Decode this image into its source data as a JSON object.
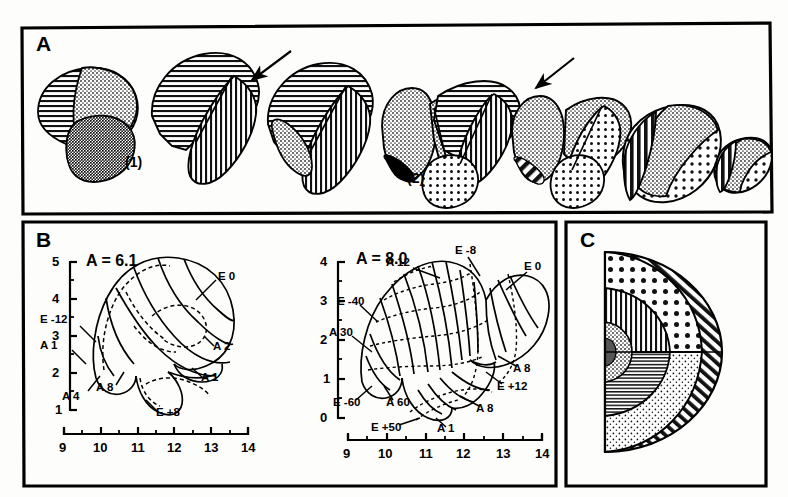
{
  "figure": {
    "panels": [
      "A",
      "B",
      "C"
    ],
    "background_color": "#fdfdfb",
    "ink_color": "#000000"
  },
  "panel_a": {
    "letter": "A",
    "caption_marks": [
      {
        "label": "(1)",
        "x": 128,
        "y": 165
      },
      {
        "label": "(2)",
        "x": 410,
        "y": 182
      }
    ],
    "arrows": [
      {
        "name": "arrow-upper-left",
        "x1": 289,
        "y1": 53,
        "x2": 252,
        "y2": 80
      },
      {
        "name": "arrow-upper-right",
        "x1": 572,
        "y1": 60,
        "x2": 536,
        "y2": 88
      }
    ],
    "specimens": [
      {
        "index": 1,
        "fills": [
          "horizontal-hatch",
          "stipple-medium",
          "stipple-coarse"
        ]
      },
      {
        "index": 2,
        "fills": [
          "horizontal-hatch",
          "vertical-hatch"
        ]
      },
      {
        "index": 3,
        "fills": [
          "horizontal-hatch",
          "vertical-hatch",
          "stipple-medium"
        ]
      },
      {
        "index": 4,
        "fills": [
          "stipple-medium",
          "horizontal-hatch",
          "vertical-hatch",
          "dot-grid",
          "solid-black"
        ]
      },
      {
        "index": 5,
        "fills": [
          "stipple-medium",
          "dot-grid",
          "solid-black"
        ]
      },
      {
        "index": 6,
        "fills": [
          "stipple-medium",
          "dot-grid",
          "vertical-hatch-bold"
        ]
      },
      {
        "index": 7,
        "fills": [
          "dot-grid",
          "vertical-hatch-bold"
        ]
      }
    ]
  },
  "panel_b": {
    "letter": "B",
    "charts": [
      {
        "id": "chart-left",
        "title": "A = 6.1",
        "x_axis": {
          "min": 9,
          "max": 14,
          "ticks": [
            9,
            10,
            11,
            12,
            13,
            14
          ],
          "minor_per_major": 2
        },
        "y_axis": {
          "min": 1,
          "max": 5,
          "ticks": [
            1,
            2,
            3,
            4,
            5
          ],
          "minor_per_major": 2
        },
        "annotations": [
          {
            "label": "E 0",
            "lx": 222,
            "ly": 276,
            "tx": 198,
            "ty": 296
          },
          {
            "label": "E -12",
            "lx": 62,
            "ly": 320,
            "tx": 85,
            "ty": 335
          },
          {
            "label": "A 1",
            "lx": 54,
            "ly": 344,
            "tx": 72,
            "ty": 360
          },
          {
            "label": "A 2",
            "lx": 216,
            "ly": 350,
            "tx": 200,
            "ty": 337
          },
          {
            "label": "A 1",
            "lx": 204,
            "ly": 381,
            "tx": 190,
            "ty": 369
          },
          {
            "label": "A 4",
            "lx": 68,
            "ly": 397,
            "tx": 88,
            "ty": 377
          },
          {
            "label": "A 8",
            "lx": 100,
            "ly": 389,
            "tx": 112,
            "ty": 372
          },
          {
            "label": "E +8",
            "lx": 155,
            "ly": 415,
            "tx": 140,
            "ty": 398
          }
        ]
      },
      {
        "id": "chart-right",
        "title": "A = 8.0",
        "x_axis": {
          "min": 9,
          "max": 14,
          "ticks": [
            9,
            10,
            11,
            12,
            13,
            14
          ],
          "minor_per_major": 2
        },
        "y_axis": {
          "min": 0,
          "max": 4,
          "ticks": [
            0,
            1,
            2,
            3,
            4
          ],
          "minor_per_major": 2
        },
        "annotations": [
          {
            "label": "A 12",
            "lx": 409,
            "ly": 262,
            "tx": 438,
            "ty": 276
          },
          {
            "label": "E -8",
            "lx": 466,
            "ly": 251,
            "tx": 478,
            "ty": 272
          },
          {
            "label": "E 0",
            "lx": 528,
            "ly": 266,
            "tx": 506,
            "ty": 288
          },
          {
            "label": "E -40",
            "lx": 344,
            "ly": 301,
            "tx": 372,
            "ty": 320
          },
          {
            "label": "A 30",
            "lx": 336,
            "ly": 332,
            "tx": 368,
            "ty": 349
          },
          {
            "label": "A 8",
            "lx": 516,
            "ly": 370,
            "tx": 498,
            "ty": 357
          },
          {
            "label": "E +12",
            "lx": 498,
            "ly": 388,
            "tx": 484,
            "ty": 374
          },
          {
            "label": "E -60",
            "lx": 339,
            "ly": 404,
            "tx": 368,
            "ty": 388
          },
          {
            "label": "A 60",
            "lx": 392,
            "ly": 404,
            "tx": 382,
            "ty": 388
          },
          {
            "label": "A 8",
            "lx": 478,
            "ly": 410,
            "tx": 460,
            "ty": 398
          },
          {
            "label": "E +50",
            "lx": 380,
            "ly": 428,
            "tx": 414,
            "ty": 418
          },
          {
            "label": "A 1",
            "lx": 442,
            "ly": 430,
            "tx": 432,
            "ty": 418
          }
        ]
      }
    ]
  },
  "panel_c": {
    "letter": "C",
    "bands": [
      {
        "name": "outer-diagonal-hatch",
        "fill": "diagonal-hatch-bold"
      },
      {
        "name": "upper-dot-grid",
        "fill": "dot-grid-large"
      },
      {
        "name": "lower-stipple",
        "fill": "stipple-fine"
      },
      {
        "name": "inner-vertical-hatch",
        "fill": "vertical-hatch"
      },
      {
        "name": "inner-horizontal-hatch",
        "fill": "horizontal-hatch"
      },
      {
        "name": "core-stipple",
        "fill": "stipple-medium"
      }
    ]
  }
}
